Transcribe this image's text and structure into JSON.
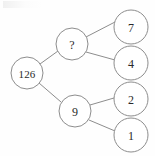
{
  "diagram": {
    "type": "tree",
    "stroke_color": "#8d8d8d",
    "text_color": "#2a2a2a",
    "background_color": "#fefefe",
    "nodes": [
      {
        "id": "root",
        "label": "126",
        "cx": 27,
        "cy": 73,
        "r": 16
      },
      {
        "id": "n-q",
        "label": "?",
        "cx": 72,
        "cy": 44,
        "r": 16
      },
      {
        "id": "n-9",
        "label": "9",
        "cx": 75,
        "cy": 111,
        "r": 16
      },
      {
        "id": "n-7",
        "label": "7",
        "cx": 131,
        "cy": 27,
        "r": 17
      },
      {
        "id": "n-4",
        "label": "4",
        "cx": 131,
        "cy": 63,
        "r": 17
      },
      {
        "id": "n-2",
        "label": "2",
        "cx": 131,
        "cy": 99,
        "r": 17
      },
      {
        "id": "n-1",
        "label": "1",
        "cx": 131,
        "cy": 135,
        "r": 17
      }
    ],
    "edges": [
      {
        "id": "edge-root-q",
        "from": "root",
        "to": "n-q",
        "x1": 40,
        "y1": 64,
        "x2": 58,
        "y2": 51
      },
      {
        "id": "edge-root-9",
        "from": "root",
        "to": "n-9",
        "x1": 39,
        "y1": 83,
        "x2": 61,
        "y2": 102
      },
      {
        "id": "edge-q-7",
        "from": "n-q",
        "to": "n-7",
        "x1": 86,
        "y1": 37,
        "x2": 115,
        "y2": 22
      },
      {
        "id": "edge-q-4",
        "from": "n-q",
        "to": "n-4",
        "x1": 86,
        "y1": 52,
        "x2": 115,
        "y2": 60
      },
      {
        "id": "edge-9-2",
        "from": "n-9",
        "to": "n-2",
        "x1": 90,
        "y1": 105,
        "x2": 114,
        "y2": 98
      },
      {
        "id": "edge-9-1",
        "from": "n-9",
        "to": "n-1",
        "x1": 89,
        "y1": 120,
        "x2": 115,
        "y2": 131
      }
    ]
  }
}
